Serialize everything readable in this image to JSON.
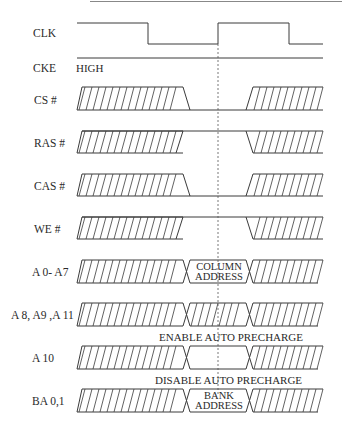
{
  "colors": {
    "line": "#3a3a3a",
    "text": "#2a2a2a",
    "background": "#ffffff",
    "rule": "#888888"
  },
  "geometry": {
    "x_start": 77,
    "x_end": 323,
    "t0": 183,
    "t0b": 190,
    "t1": 246,
    "t1b": 253,
    "clk_edge_marker_x": 218
  },
  "signals": [
    {
      "name": "CLK",
      "label": "CLK",
      "type": "clock",
      "y_high": 23,
      "y_low": 44
    },
    {
      "name": "CKE",
      "label": "CKE",
      "type": "level",
      "y": 58,
      "note": "HIGH"
    },
    {
      "name": "CS",
      "label": "CS #",
      "type": "pulse_low",
      "top": 87,
      "bottom": 110
    },
    {
      "name": "RAS",
      "label": "RAS #",
      "type": "pulse_high",
      "top": 131,
      "bottom": 153
    },
    {
      "name": "CAS",
      "label": "CAS #",
      "type": "pulse_low",
      "top": 174,
      "bottom": 196
    },
    {
      "name": "WE",
      "label": "WE #",
      "type": "pulse_high",
      "top": 217,
      "bottom": 239
    },
    {
      "name": "A0-A7",
      "label": "A 0- A7",
      "type": "bus_valid",
      "top": 260,
      "bottom": 283,
      "value_lines": [
        "COLUMN",
        "ADDRESS"
      ]
    },
    {
      "name": "A8-A9-A11",
      "label": "A 8, A9 ,A 11",
      "type": "bus_dontcare",
      "top": 303,
      "bottom": 326
    },
    {
      "name": "A10",
      "label": "A 10",
      "type": "bus_valid",
      "top": 346,
      "bottom": 369,
      "value_lines": []
    },
    {
      "name": "BA0-1",
      "label": "BA 0,1",
      "type": "bus_valid",
      "top": 389,
      "bottom": 412,
      "value_lines": [
        "BANK",
        "ADDRESS"
      ]
    }
  ],
  "annotations": {
    "enable": "ENABLE AUTO PRECHARGE",
    "disable": "DISABLE AUTO PRECHARGE"
  }
}
